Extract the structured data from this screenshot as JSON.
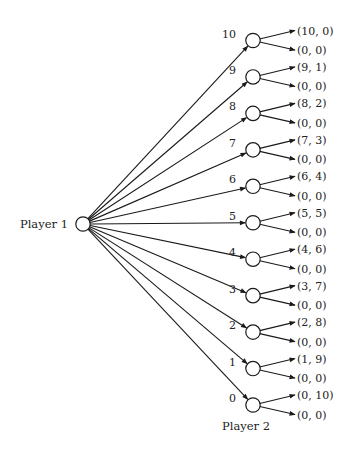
{
  "diagram": {
    "type": "game-tree",
    "root": {
      "label": "Player 1"
    },
    "second_mover": {
      "label": "Player 2"
    },
    "offers": [
      {
        "action": "10",
        "accept": "(10, 0)",
        "reject": "(0, 0)"
      },
      {
        "action": "9",
        "accept": "(9, 1)",
        "reject": "(0, 0)"
      },
      {
        "action": "8",
        "accept": "(8, 2)",
        "reject": "(0, 0)"
      },
      {
        "action": "7",
        "accept": "(7, 3)",
        "reject": "(0, 0)"
      },
      {
        "action": "6",
        "accept": "(6, 4)",
        "reject": "(0, 0)"
      },
      {
        "action": "5",
        "accept": "(5, 5)",
        "reject": "(0, 0)"
      },
      {
        "action": "4",
        "accept": "(4, 6)",
        "reject": "(0, 0)"
      },
      {
        "action": "3",
        "accept": "(3, 7)",
        "reject": "(0, 0)"
      },
      {
        "action": "2",
        "accept": "(2, 8)",
        "reject": "(0, 0)"
      },
      {
        "action": "1",
        "accept": "(1, 9)",
        "reject": "(0, 0)"
      },
      {
        "action": "0",
        "accept": "(0, 10)",
        "reject": "(0, 0)"
      }
    ]
  }
}
